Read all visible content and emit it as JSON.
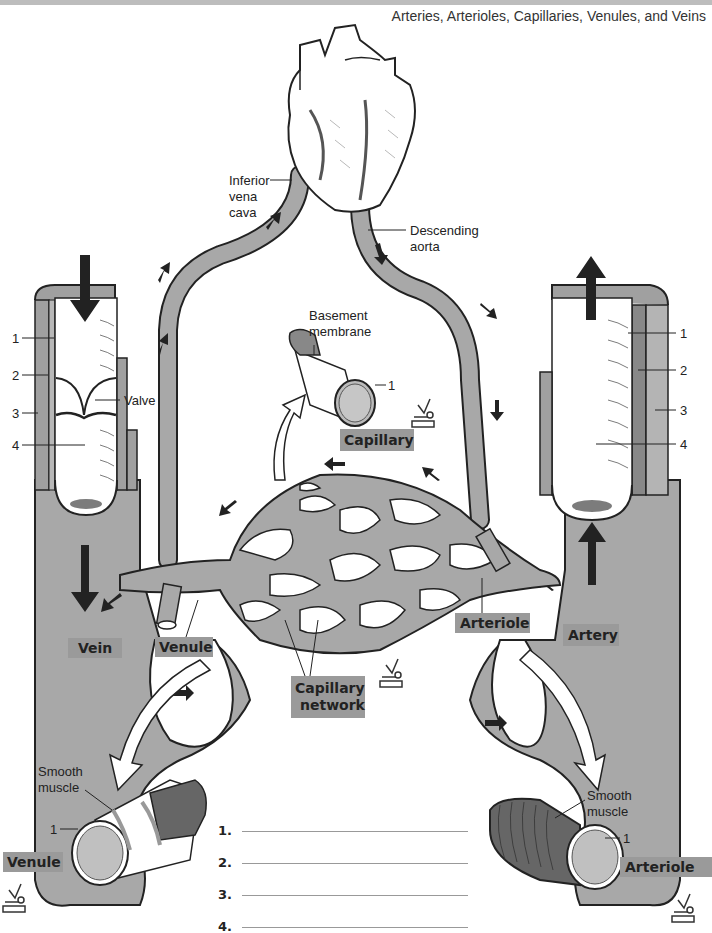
{
  "page": {
    "title": "Arteries, Arterioles, Capillaries, Venules, and Veins"
  },
  "labels": {
    "inferior_vena_cava": [
      "Inferior",
      "vena",
      "cava"
    ],
    "descending_aorta": [
      "Descending",
      "aorta"
    ],
    "basement_membrane": [
      "Basement",
      "membrane"
    ],
    "valve": "Valve",
    "smooth_muscle_left": [
      "Smooth",
      "muscle"
    ],
    "smooth_muscle_right": [
      "Smooth",
      "muscle"
    ]
  },
  "tags": {
    "vein": "Vein",
    "venule_top": "Venule",
    "capillary": "Capillary",
    "capillary_network": [
      "Capillary",
      "network"
    ],
    "arteriole_top": "Arteriole",
    "artery": "Artery",
    "venule_bottom": "Venule",
    "arteriole_bottom": "Arteriole"
  },
  "vein_layers": [
    "1",
    "2",
    "3",
    "4"
  ],
  "artery_layers": [
    "1",
    "2",
    "3",
    "4"
  ],
  "capillary_layer": "1",
  "venule_layer": "1",
  "arteriole_layer": "1",
  "answers": [
    {
      "num": "1.",
      "value": ""
    },
    {
      "num": "2.",
      "value": ""
    },
    {
      "num": "3.",
      "value": ""
    },
    {
      "num": "4.",
      "value": ""
    }
  ],
  "colors": {
    "vessel_gray": "#a8a8a8",
    "dark_gray": "#777777",
    "tag_gray": "#9a9a9a",
    "outline": "#222222"
  }
}
